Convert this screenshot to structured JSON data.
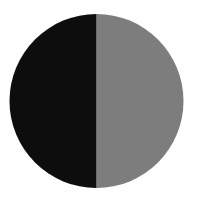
{
  "figure": {
    "canvas": {
      "width": 201,
      "height": 197,
      "background_color": "#fefefe"
    },
    "circle": {
      "center_x": 96.5,
      "center_y": 101,
      "radius": 87,
      "diameter": 174,
      "bounds": {
        "left": 10,
        "top": 12,
        "right": 183,
        "bottom": 190
      }
    },
    "halves": [
      {
        "name": "left-half",
        "side": "left",
        "fill_color": "#0d0d0d",
        "fill_label": "black",
        "fraction": 0.5,
        "degrees": 180
      },
      {
        "name": "right-half",
        "side": "right",
        "fill_color": "#7d7d7d",
        "fill_label": "gray",
        "fraction": 0.5,
        "degrees": 180
      }
    ],
    "divider": {
      "name": "vertical-divider",
      "orientation": "vertical",
      "x": 96.5,
      "y_start": 14,
      "y_end": 188
    },
    "edge": {
      "antialiased": true,
      "rim_softness_px": 1.2
    }
  },
  "chart_data": {
    "type": "pie",
    "categories": [
      "Left half",
      "Right half"
    ],
    "values": [
      50,
      50
    ],
    "colors": [
      "#0d0d0d",
      "#7d7d7d"
    ],
    "labels_visible": false,
    "legend": "none",
    "start_angle_deg": 90,
    "units": "percent"
  }
}
